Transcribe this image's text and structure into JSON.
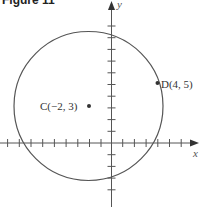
{
  "figure": {
    "title": "Figure 11",
    "x_axis_label": "x",
    "y_axis_label": "y"
  },
  "points": {
    "center": {
      "label": "C(−2, 3)",
      "x": -2,
      "y": 3
    },
    "on_circle": {
      "label": "D(4, 5)",
      "x": 4,
      "y": 5
    }
  },
  "circle": {
    "center": [
      -2,
      3
    ],
    "radius_squared": 40
  },
  "colors": {
    "curve": "#555555",
    "axis": "#555555",
    "text": "#333333"
  }
}
